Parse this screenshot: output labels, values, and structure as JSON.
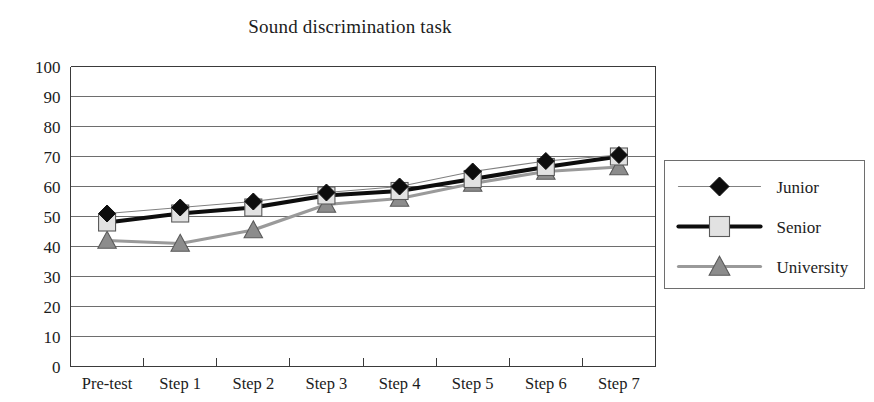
{
  "chart": {
    "title": "Sound discrimination task"
  },
  "chart_data": {
    "type": "line",
    "title": "Sound discrimination task",
    "xlabel": "",
    "ylabel": "",
    "ylim": [
      0,
      100
    ],
    "ytick_step": 10,
    "grid": true,
    "legend_position": "right-outside",
    "categories": [
      "Pre-test",
      "Step 1",
      "Step 2",
      "Step 3",
      "Step 4",
      "Step 5",
      "Step 6",
      "Step 7"
    ],
    "ytick_labels": [
      "100",
      "90",
      "80",
      "70",
      "60",
      "50",
      "40",
      "30",
      "20",
      "10",
      "0"
    ],
    "series": [
      {
        "name": "Junior",
        "marker": "diamond",
        "marker_color": "#0d0d0d",
        "line_color": "#808080",
        "line_width": 1.2,
        "values": [
          51,
          53,
          55,
          58,
          60,
          65,
          68.5,
          70.5
        ]
      },
      {
        "name": "Senior",
        "marker": "square",
        "marker_color": "#e2e2e2",
        "line_color": "#0d0d0d",
        "line_width": 4.2,
        "values": [
          48,
          51,
          53,
          57,
          58.5,
          62.5,
          66.5,
          70
        ]
      },
      {
        "name": "University",
        "marker": "triangle",
        "marker_color": "#8c8c8c",
        "line_color": "#9a9a9a",
        "line_width": 3.2,
        "values": [
          42,
          41,
          45.5,
          54,
          56,
          61,
          65,
          66.5
        ]
      }
    ]
  }
}
